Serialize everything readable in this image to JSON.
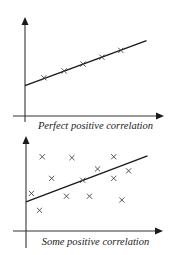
{
  "chart_data": [
    {
      "type": "scatter",
      "title": "Perfect positive correlation",
      "xlabel": "",
      "ylabel": "",
      "xlim": [
        0,
        10
      ],
      "ylim": [
        0,
        10
      ],
      "grid": false,
      "axes_style": "arrows, no tick labels",
      "points": [
        {
          "x": 1.4,
          "y": 3.9
        },
        {
          "x": 2.9,
          "y": 4.6
        },
        {
          "x": 4.3,
          "y": 5.3
        },
        {
          "x": 5.7,
          "y": 6.0
        },
        {
          "x": 7.1,
          "y": 6.7
        }
      ],
      "trend_line": {
        "x0": 0,
        "y0": 3.1,
        "x1": 9.0,
        "y1": 7.7
      },
      "marker": "x"
    },
    {
      "type": "scatter",
      "title": "Some positive correlation",
      "xlabel": "",
      "ylabel": "",
      "xlim": [
        0,
        10
      ],
      "ylim": [
        0,
        10
      ],
      "grid": false,
      "axes_style": "arrows, no tick labels",
      "points": [
        {
          "x": 1.2,
          "y": 7.9
        },
        {
          "x": 3.4,
          "y": 7.8
        },
        {
          "x": 6.5,
          "y": 7.9
        },
        {
          "x": 1.9,
          "y": 5.6
        },
        {
          "x": 5.3,
          "y": 6.6
        },
        {
          "x": 7.6,
          "y": 6.4
        },
        {
          "x": 4.2,
          "y": 5.4
        },
        {
          "x": 6.5,
          "y": 5.6
        },
        {
          "x": 0.4,
          "y": 4.0
        },
        {
          "x": 3.0,
          "y": 3.7
        },
        {
          "x": 4.7,
          "y": 3.7
        },
        {
          "x": 7.1,
          "y": 3.3
        },
        {
          "x": 1.0,
          "y": 2.2
        }
      ],
      "trend_line": {
        "x0": 0,
        "y0": 3.1,
        "x1": 9.0,
        "y1": 8.0
      },
      "marker": "x"
    }
  ],
  "charts": {
    "top": {
      "caption": "Perfect positive correlation"
    },
    "bottom": {
      "caption": "Some positive correlation"
    }
  },
  "colors": {
    "ink": "#1a1a1a",
    "axis": "#333333",
    "marker": "#444444",
    "background": "#ffffff"
  }
}
